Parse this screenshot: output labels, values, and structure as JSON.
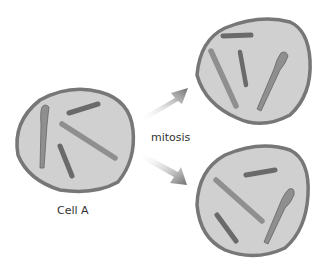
{
  "diagram": {
    "labels": {
      "parent_cell": "Cell A",
      "process": "mitosis"
    },
    "colors": {
      "cell_fill": "#d0d0d0",
      "cell_border": "#777777",
      "chromosome_light": "#8f8f8f",
      "chromosome_dark": "#6a6a6a",
      "arrow": "#7a7a7a",
      "background": "#ffffff"
    },
    "cells": [
      {
        "id": "cell-a",
        "role": "parent",
        "chromosome_count": 4
      },
      {
        "id": "daughter-top",
        "role": "daughter",
        "chromosome_count": 4
      },
      {
        "id": "daughter-bottom",
        "role": "daughter",
        "chromosome_count": 4
      }
    ]
  }
}
